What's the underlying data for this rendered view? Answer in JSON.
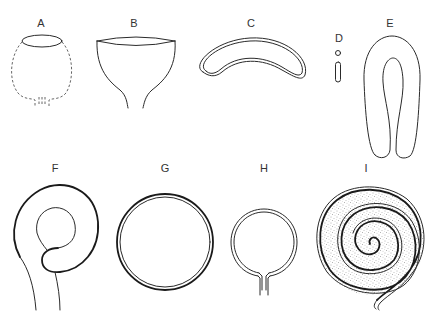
{
  "figure": {
    "panels": [
      {
        "id": "A",
        "label": "A",
        "description": "globular vessel with dashed outline and open rim"
      },
      {
        "id": "B",
        "label": "B",
        "description": "funnel/cup shape with open rim narrowing to stem"
      },
      {
        "id": "C",
        "label": "C",
        "description": "curved crescent (kidney) shape with double outline"
      },
      {
        "id": "D",
        "label": "D",
        "description": "tiny circle and small elongated capsule"
      },
      {
        "id": "E",
        "label": "E",
        "description": "elongated U-shaped (horseshoe) loop"
      },
      {
        "id": "F",
        "label": "F",
        "description": "coiled loop with inner ring and two trailing tails"
      },
      {
        "id": "G",
        "label": "G",
        "description": "closed double-walled circle"
      },
      {
        "id": "H",
        "label": "H",
        "description": "double-walled ring open at the bottom with two stubs"
      },
      {
        "id": "I",
        "label": "I",
        "description": "stippled spiral coil with trailing tail"
      }
    ],
    "colors": {
      "background": "#ffffff",
      "line": "#2a2a2a",
      "label": "#333333",
      "stipple": "#555555"
    }
  }
}
